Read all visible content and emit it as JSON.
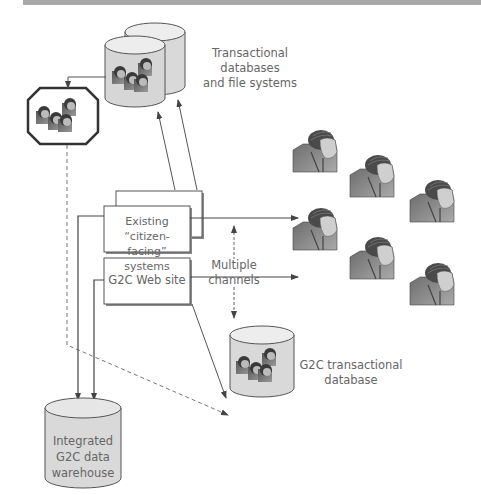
{
  "figure": {
    "top_rule_color": "#a8a8a8",
    "line_color": "#555555",
    "fill_light": "#d6d6d6",
    "fill_box": "#ffffff",
    "text_color": "#666666"
  },
  "nodes": {
    "transactional_dbs": {
      "label_line1": "Transactional databases",
      "label_line2": "and file systems",
      "icon": "stacked-database-cylinders-with-people"
    },
    "octagon_group": {
      "icon": "octagon-people-group"
    },
    "existing_systems": {
      "label_line1": "Existing “citizen-",
      "label_line2": "facing” systems"
    },
    "g2c_web_site": {
      "label": "G2C Web site"
    },
    "multiple_channels": {
      "label_line1": "Multiple",
      "label_line2": "channels"
    },
    "g2c_transactional_db": {
      "label_line1": "G2C transactional",
      "label_line2": "database",
      "icon": "database-cylinder-with-people"
    },
    "data_warehouse": {
      "label_line1": "Integrated",
      "label_line2": "G2C data",
      "label_line3": "warehouse"
    },
    "citizens": {
      "count": 6,
      "icon": "citizen-portrait"
    }
  }
}
